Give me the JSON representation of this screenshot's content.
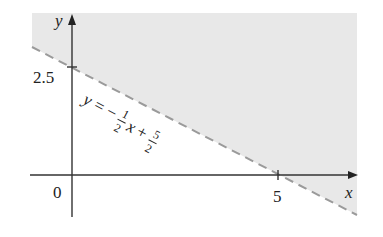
{
  "figure": {
    "type": "linear-inequality-graph",
    "axes": {
      "x_label": "x",
      "y_label": "y",
      "origin_label": "0",
      "x_tick_label": "5",
      "y_tick_label": "2.5"
    },
    "boundary_line": {
      "equation_parts": {
        "lhs": "y",
        "eq": "=",
        "minus": "−",
        "frac1_num": "1",
        "frac1_den": "2",
        "x": "x",
        "plus": "+",
        "frac2_num": "5",
        "frac2_den": "2"
      },
      "style": "dashed",
      "color": "#9a9a9a"
    },
    "shaded_region": {
      "description": "region above the line",
      "color": "#e8e8e8"
    }
  }
}
